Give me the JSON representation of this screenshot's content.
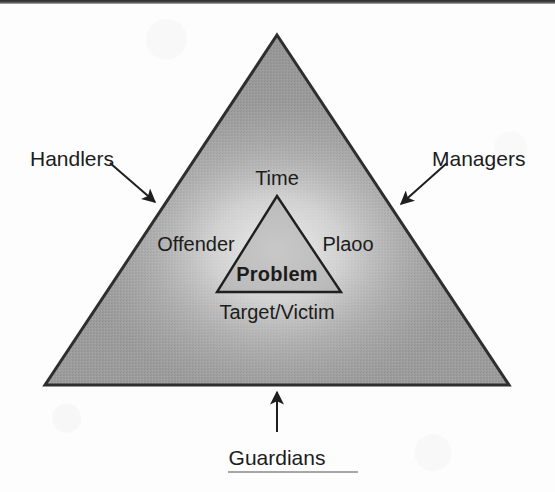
{
  "diagram": {
    "outer_triangle": {
      "name": "outer-triangle",
      "fill_color": "#9d9d9d",
      "stroke_color": "#2e2e2e",
      "apex": [
        277,
        35
      ],
      "bottom_left": [
        45,
        385
      ],
      "bottom_right": [
        509,
        385
      ]
    },
    "inner_triangle": {
      "name": "inner-triangle",
      "fill_color": "#a8a8a8",
      "stroke_color": "#1f1f1f",
      "apex": [
        277,
        196
      ],
      "bottom_left": [
        217,
        292
      ],
      "bottom_right": [
        341,
        292
      ]
    },
    "inner_labels": [
      {
        "id": "time",
        "text": "Time",
        "x": 277,
        "y": 168
      },
      {
        "id": "offender",
        "text": "Offender",
        "x": 196,
        "y": 234
      },
      {
        "id": "place",
        "text": "Plaoo",
        "x": 348,
        "y": 234
      },
      {
        "id": "problem",
        "text": "Problem",
        "x": 277,
        "y": 264
      },
      {
        "id": "target-victim",
        "text": "Target/Victim",
        "x": 277,
        "y": 302
      }
    ],
    "outer_labels": [
      {
        "id": "handlers",
        "text": "Handlers",
        "x": 30,
        "y": 148
      },
      {
        "id": "managers",
        "text": "Managers",
        "x": 432,
        "y": 148
      },
      {
        "id": "guardians",
        "text": "Guardians",
        "x": 277,
        "y": 447
      }
    ],
    "arrows": [
      {
        "id": "handlers-arrow",
        "from": [
          110,
          163
        ],
        "to": [
          158,
          205
        ]
      },
      {
        "id": "managers-arrow",
        "from": [
          447,
          163
        ],
        "to": [
          398,
          207
        ]
      },
      {
        "id": "guardians-arrow",
        "from": [
          277,
          432
        ],
        "to": [
          277,
          389
        ]
      }
    ],
    "colors": {
      "ink": "#1c1c1c",
      "outline": "#2e2e2e",
      "triangle_gray": "#9d9d9d",
      "glow": "#e8e8e8",
      "page": "#fdfdfd"
    }
  }
}
